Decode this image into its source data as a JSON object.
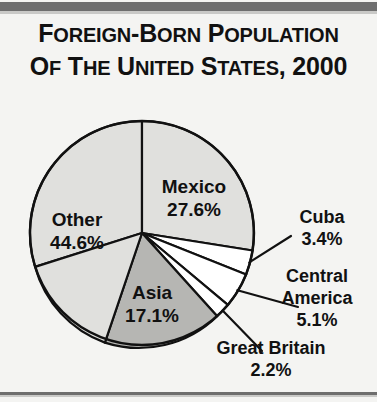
{
  "title": {
    "line1": "Foreign-Born Population",
    "line2": "of the United States, 2000"
  },
  "colors": {
    "background": "#f4f4f2",
    "rule": "#6e6e6e",
    "outline": "#111111",
    "slice_light": "#e0e0dd",
    "slice_medium": "#b6b6b3",
    "slice_white": "#ffffff",
    "text": "#111111"
  },
  "chart_data": {
    "type": "pie",
    "title": "Foreign-Born Population of the United States, 2000",
    "subtitle": "",
    "xlabel": "",
    "ylabel": "",
    "units": "percent",
    "start_angle_deg": 0,
    "direction": "clockwise",
    "legend_position": "none",
    "grid": false,
    "categories": [
      "Mexico",
      "Cuba",
      "Central America",
      "Great Britain",
      "Asia",
      "Other"
    ],
    "values": [
      27.6,
      3.4,
      5.1,
      2.2,
      17.1,
      44.6
    ],
    "slices": [
      {
        "label": "Mexico",
        "value": 27.6,
        "value_text": "27.6%",
        "fill": "slice_light",
        "label_placement": "inside"
      },
      {
        "label": "Cuba",
        "value": 3.4,
        "value_text": "3.4%",
        "fill": "slice_white",
        "label_placement": "callout"
      },
      {
        "label": "Central America",
        "value": 5.1,
        "value_text": "5.1%",
        "fill": "slice_white",
        "label_placement": "callout"
      },
      {
        "label": "Great Britain",
        "value": 2.2,
        "value_text": "2.2%",
        "fill": "slice_white",
        "label_placement": "callout"
      },
      {
        "label": "Asia",
        "value": 17.1,
        "value_text": "17.1%",
        "fill": "slice_medium",
        "label_placement": "inside"
      },
      {
        "label": "Other",
        "value": 44.6,
        "value_text": "44.6%",
        "fill": "slice_light",
        "label_placement": "inside"
      }
    ]
  },
  "labels": {
    "mexico_name": "Mexico",
    "mexico_value": "27.6%",
    "other_name": "Other",
    "other_value": "44.6%",
    "asia_name": "Asia",
    "asia_value": "17.1%",
    "cuba_name": "Cuba",
    "cuba_value": "3.4%",
    "central_name_1": "Central",
    "central_name_2": "America",
    "central_value": "5.1%",
    "britain_name": "Great Britain",
    "britain_value": "2.2%"
  }
}
